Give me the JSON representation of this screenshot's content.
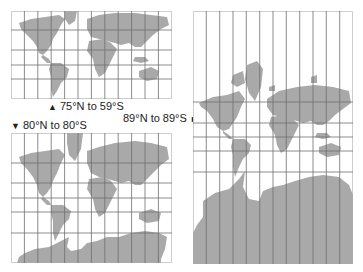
{
  "figure": {
    "colors": {
      "land": "#a9a9a9",
      "grid": "#6e6e6e",
      "border": "#9a9a9a",
      "background": "#ffffff",
      "text": "#222222"
    }
  },
  "maps": [
    {
      "id": "map-75n-59s",
      "range_label": "75°N to 59°S",
      "arrow": "▲",
      "arrow_position": "before",
      "columns": 12
    },
    {
      "id": "map-80n-80s",
      "range_label": "80°N to 80°S",
      "arrow": "▼",
      "arrow_position": "before",
      "columns": 12
    },
    {
      "id": "map-89n-89s",
      "range_label": "89°N to 89°S",
      "arrow": "►",
      "arrow_position": "after",
      "columns": 12
    }
  ]
}
